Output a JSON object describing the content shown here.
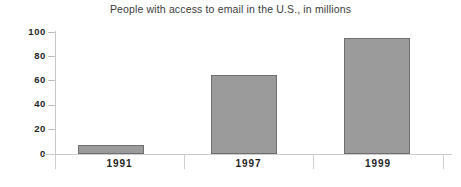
{
  "chart_data": {
    "type": "bar",
    "title": "People with access to email in the U.S., in millions",
    "xlabel": "",
    "ylabel": "",
    "categories": [
      "1991",
      "1997",
      "1999"
    ],
    "values": [
      7,
      65,
      95
    ],
    "ylim": [
      0,
      100
    ],
    "yticks": [
      "0",
      "20",
      "40",
      "60",
      "80",
      "100"
    ],
    "ytick_values": [
      0,
      20,
      40,
      60,
      80,
      100
    ],
    "grid": false,
    "legend": "none",
    "series": [
      {
        "name": "People with access to email (millions)",
        "values": [
          7,
          65,
          95
        ]
      }
    ],
    "colors": {
      "bar_fill": "#9b9b9b",
      "bar_border": "#6f6f6f",
      "axis": "#cccccc",
      "text": "#1f1f1f",
      "title_text": "#3a3a3a",
      "background": "#ffffff"
    }
  }
}
